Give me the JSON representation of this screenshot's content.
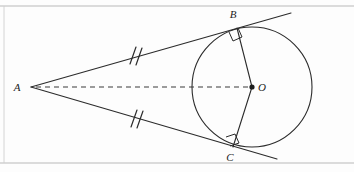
{
  "figure": {
    "type": "geometry-diagram",
    "background_color": "#fdfdfd",
    "stroke_color": "#2b2b2b",
    "border_color": "#b9b9b9",
    "labels": {
      "vertex": "A",
      "tangent_point_upper": "B",
      "tangent_point_lower": "C",
      "center": "O"
    },
    "points": {
      "A": {
        "x": 31,
        "y": 87,
        "label": "A",
        "label_x": 17,
        "label_y": 91
      },
      "B": {
        "x": 237,
        "y": 28,
        "label": "B",
        "label_x": 233,
        "label_y": 18
      },
      "C": {
        "x": 233,
        "y": 147,
        "label": "C",
        "label_x": 230,
        "label_y": 161
      },
      "O": {
        "x": 252,
        "y": 87,
        "label": "O",
        "label_x": 262,
        "label_y": 91
      }
    },
    "circle": {
      "cx": 252,
      "cy": 87,
      "r": 60
    },
    "segments": [
      {
        "name": "tangent-AB",
        "x1": 31,
        "y1": 87,
        "x2": 237,
        "y2": 28,
        "style": "solid"
      },
      {
        "name": "tangent-AC",
        "x1": 31,
        "y1": 87,
        "x2": 233,
        "y2": 147,
        "style": "solid"
      },
      {
        "name": "radius-OB",
        "x1": 252,
        "y1": 87,
        "x2": 237,
        "y2": 28,
        "style": "solid"
      },
      {
        "name": "radius-OC",
        "x1": 252,
        "y1": 87,
        "x2": 233,
        "y2": 147,
        "style": "solid"
      },
      {
        "name": "axis-AO",
        "x1": 33,
        "y1": 87,
        "x2": 250,
        "y2": 87,
        "style": "dashed"
      }
    ],
    "tangent_extensions": [
      {
        "name": "tangent-line-upper-extension",
        "x1": 237,
        "y1": 28,
        "x2": 291,
        "y2": 13
      },
      {
        "name": "tangent-line-lower-extension",
        "x1": 233,
        "y1": 147,
        "x2": 277,
        "y2": 159
      }
    ],
    "tick_marks": [
      {
        "name": "congruence-tick-AB",
        "x": 135,
        "y": 55,
        "count": 2
      },
      {
        "name": "congruence-tick-AC",
        "x": 135,
        "y": 118,
        "count": 2
      }
    ],
    "right_angles": [
      {
        "name": "right-angle-at-B",
        "x": 237,
        "y": 28
      },
      {
        "name": "right-angle-at-C",
        "x": 233,
        "y": 147
      }
    ],
    "borders": {
      "top_rule_y": 6,
      "bottom_rule_y": 163,
      "left_rule_x": 4
    }
  }
}
